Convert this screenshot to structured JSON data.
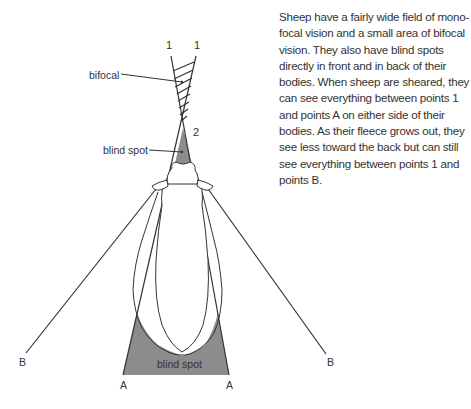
{
  "caption": {
    "lines": [
      "Sheep have a fairly wide field of mono-",
      "focal vision and a small area of bifocal",
      "vision. They also have blind spots",
      "directly in front and in back of their",
      "bodies. When sheep are sheared, they",
      "can see everything between points 1",
      "and points A on either side of their",
      "bodies. As their fleece grows out, they",
      "see less toward the back but can still",
      "see everything between points 1 and",
      "points B."
    ]
  },
  "labels": {
    "bifocal": "bifocal",
    "blind_spot_front": "blind spot",
    "blind_spot_back": "blind spot",
    "point_1_left": "1",
    "point_1_right": "1",
    "point_2": "2",
    "point_a_left": "A",
    "point_a_right": "A",
    "point_b_left": "B",
    "point_b_right": "B"
  },
  "colors": {
    "blind_spot_fill": "#8c8c8c",
    "line": "#333333",
    "text": "#333333"
  }
}
